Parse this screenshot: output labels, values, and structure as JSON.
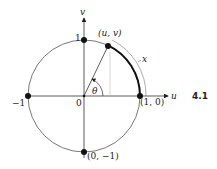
{
  "figure": {
    "number": "4.1",
    "axes": {
      "horizontal_label": "u",
      "vertical_label": "v"
    },
    "points": {
      "top": "1",
      "left": "−1",
      "right": "(1, 0)",
      "bottom": "(0, −1)",
      "origin": "0",
      "on_circle": "(u, v)"
    },
    "angle_label": "θ",
    "arc_label": "x",
    "colors": {
      "ink": "#222222",
      "thin_line": "#555555",
      "faint_line": "#bbbbbb"
    }
  }
}
